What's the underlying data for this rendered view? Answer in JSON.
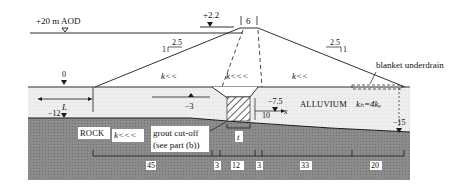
{
  "diagram": {
    "type": "dam cross-section",
    "colors": {
      "background": "#ffffff",
      "alluvium": "#ececec",
      "rock": "#8a8a8a",
      "line": "#1a1a1a",
      "label_bg": "#ffffff"
    },
    "water_levels": {
      "upstream": "+20 m AOD",
      "tailwater": "+2.2",
      "ground_upstream": "0",
      "alluvium_base_upstream": "−12",
      "cutoff_base": "−7.5",
      "alluvium_base_downstream": "−15",
      "piezometer": "−3"
    },
    "crest_width": "6",
    "slopes": {
      "upstream": {
        "horizontal": "2.5",
        "vertical": "1"
      },
      "downstream": {
        "horizontal": "2.5",
        "vertical": "1"
      }
    },
    "permeability": {
      "upstream_shell": "k<<",
      "core": "k<<<",
      "downstream_shell": "k<<",
      "rock": "k<<<",
      "alluvium": "kₕ=4kᵥ"
    },
    "labels": {
      "blanket": "blanket underdrain",
      "alluvium": "ALLUVIUM",
      "rock": "ROCK",
      "grout_line1": "grout cut-off",
      "grout_line2": "(see part (b))",
      "length": "L",
      "cutoff_thickness": "t",
      "offset": "10",
      "x": "x"
    },
    "dimensions": [
      "45",
      "3",
      "12",
      "3",
      "33",
      "20"
    ]
  }
}
